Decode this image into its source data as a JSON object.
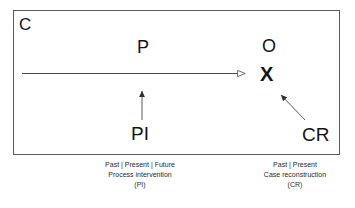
{
  "diagram": {
    "type": "process-intervention-case-reconstruction",
    "context_box": {
      "label": "C",
      "label_meaning": "Context"
    },
    "nodes": [
      {
        "id": "p",
        "label": "P",
        "role": "process"
      },
      {
        "id": "o",
        "label": "O",
        "role": "outcome"
      },
      {
        "id": "x",
        "label": "X",
        "role": "outcome-marker"
      },
      {
        "id": "pi",
        "label": "PI",
        "role": "process-intervention"
      },
      {
        "id": "cr",
        "label": "CR",
        "role": "case-reconstruction"
      }
    ],
    "arrows": [
      {
        "id": "process-flow",
        "from": "left-edge",
        "to": "x",
        "direction": "right",
        "head": "open-triangle"
      },
      {
        "id": "pi-to-process",
        "from": "pi",
        "to": "p",
        "direction": "up",
        "head": "filled-triangle"
      },
      {
        "id": "cr-to-outcome",
        "from": "cr",
        "to": "x",
        "direction": "up-left",
        "head": "filled-triangle"
      }
    ],
    "captions": {
      "left": {
        "timeframe": "Past | Present | Future",
        "title": "Process intervention",
        "abbreviation": "(PI)"
      },
      "right": {
        "timeframe": "Past | Present",
        "title": "Case reconstruction",
        "abbreviation": "(CR)"
      }
    },
    "colors": {
      "background": "#ffffff",
      "box_border": "#5a5a5a",
      "text": "#141414",
      "caption_text": "#2b2b2b",
      "arrow": "#4a4a4a"
    }
  }
}
